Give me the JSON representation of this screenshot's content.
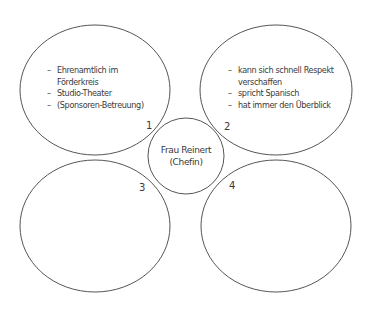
{
  "diagram": {
    "stroke_color": "#555555",
    "text_color": "#3a3a3a",
    "center": {
      "line1": "Frau Reinert",
      "line2": "(Chefin)"
    },
    "bubbles": [
      {
        "number": "1",
        "items": [
          {
            "dash": "–",
            "text": "Ehrenamtlich im"
          },
          {
            "dash": "",
            "text": "Förderkreis"
          },
          {
            "dash": "–",
            "text": "Studio-Theater"
          },
          {
            "dash": "–",
            "text": "(Sponsoren-Betreuung)"
          }
        ]
      },
      {
        "number": "2",
        "items": [
          {
            "dash": "–",
            "text": "kann sich schnell Respekt"
          },
          {
            "dash": "",
            "text": "verschaffen"
          },
          {
            "dash": "–",
            "text": "spricht Spanisch"
          },
          {
            "dash": "–",
            "text": "hat immer den Überblick"
          }
        ]
      },
      {
        "number": "3",
        "items": []
      },
      {
        "number": "4",
        "items": []
      }
    ]
  }
}
